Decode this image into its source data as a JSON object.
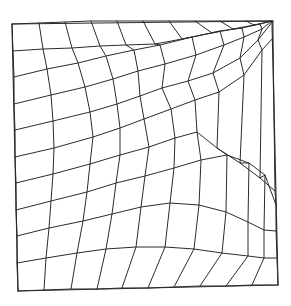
{
  "diagram": {
    "type": "structured-quadrilateral-mesh",
    "title": "",
    "line_color": "#2b2b2b",
    "background": "#ffffff",
    "grid_size": {
      "rows": 10,
      "cols": 10
    },
    "corners": {
      "top_left": [
        12,
        24
      ],
      "top_right": [
        272,
        21
      ],
      "bottom_right": [
        278,
        285
      ],
      "bottom_left": [
        18,
        291
      ]
    },
    "rows": [
      [
        [
          12,
          24
        ],
        [
          39,
          23
        ],
        [
          65,
          22
        ],
        [
          91,
          21
        ],
        [
          117,
          21
        ],
        [
          143,
          21
        ],
        [
          169,
          21
        ],
        [
          195,
          21
        ],
        [
          220,
          21
        ],
        [
          246,
          21
        ],
        [
          272,
          21
        ]
      ],
      [
        [
          13,
          51
        ],
        [
          43,
          49
        ],
        [
          72,
          48
        ],
        [
          100,
          46
        ],
        [
          126,
          45
        ],
        [
          155,
          44
        ],
        [
          182,
          39
        ],
        [
          212,
          33
        ],
        [
          233,
          29
        ],
        [
          254,
          25
        ],
        [
          272,
          21
        ]
      ],
      [
        [
          14,
          77
        ],
        [
          47,
          69
        ],
        [
          78,
          63
        ],
        [
          106,
          56
        ],
        [
          134,
          50
        ],
        [
          160,
          45
        ],
        [
          192,
          37
        ],
        [
          220,
          31
        ],
        [
          242,
          28
        ],
        [
          260,
          24
        ],
        [
          272,
          21
        ]
      ],
      [
        [
          14,
          104
        ],
        [
          51,
          95
        ],
        [
          85,
          87
        ],
        [
          113,
          79
        ],
        [
          138,
          71
        ],
        [
          165,
          64
        ],
        [
          196,
          55
        ],
        [
          224,
          45
        ],
        [
          244,
          37
        ],
        [
          262,
          29
        ],
        [
          272,
          21
        ]
      ],
      [
        [
          15,
          130
        ],
        [
          53,
          121
        ],
        [
          90,
          112
        ],
        [
          117,
          104
        ],
        [
          140,
          96
        ],
        [
          162,
          88
        ],
        [
          188,
          81
        ],
        [
          213,
          73
        ],
        [
          240,
          58
        ],
        [
          258,
          40
        ],
        [
          273,
          21
        ]
      ],
      [
        [
          15,
          157
        ],
        [
          54,
          148
        ],
        [
          93,
          137
        ],
        [
          120,
          128
        ],
        [
          144,
          119
        ],
        [
          171,
          109
        ],
        [
          195,
          100
        ],
        [
          219,
          92
        ],
        [
          244,
          75
        ],
        [
          262,
          50
        ],
        [
          273,
          38
        ]
      ],
      [
        [
          16,
          183
        ],
        [
          53,
          174
        ],
        [
          90,
          164
        ],
        [
          120,
          155
        ],
        [
          149,
          147
        ],
        [
          175,
          138
        ],
        [
          197,
          132
        ],
        [
          217,
          148
        ],
        [
          240,
          163
        ],
        [
          260,
          178
        ],
        [
          275,
          191
        ]
      ],
      [
        [
          16,
          210
        ],
        [
          51,
          201
        ],
        [
          87,
          192
        ],
        [
          116,
          183
        ],
        [
          145,
          176
        ],
        [
          174,
          168
        ],
        [
          201,
          160
        ],
        [
          227,
          155
        ],
        [
          249,
          163
        ],
        [
          265,
          175
        ],
        [
          276,
          205
        ]
      ],
      [
        [
          17,
          236
        ],
        [
          49,
          228
        ],
        [
          83,
          221
        ],
        [
          112,
          214
        ],
        [
          141,
          207
        ],
        [
          170,
          203
        ],
        [
          199,
          205
        ],
        [
          226,
          212
        ],
        [
          248,
          222
        ],
        [
          264,
          230
        ],
        [
          276,
          231
        ]
      ],
      [
        [
          17,
          263
        ],
        [
          46,
          258
        ],
        [
          77,
          253
        ],
        [
          106,
          249
        ],
        [
          136,
          247
        ],
        [
          165,
          247
        ],
        [
          194,
          249
        ],
        [
          222,
          253
        ],
        [
          248,
          256
        ],
        [
          264,
          258
        ],
        [
          277,
          258
        ]
      ],
      [
        [
          18,
          291
        ],
        [
          44,
          290
        ],
        [
          71,
          289
        ],
        [
          97,
          289
        ],
        [
          122,
          288
        ],
        [
          148,
          288
        ],
        [
          174,
          287
        ],
        [
          200,
          286
        ],
        [
          226,
          286
        ],
        [
          252,
          285
        ],
        [
          278,
          285
        ]
      ]
    ]
  }
}
